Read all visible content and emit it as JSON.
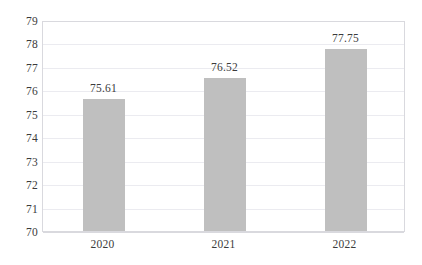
{
  "chart_data": {
    "type": "bar",
    "title": "",
    "subtitle": "",
    "xlabel": "",
    "ylabel": "",
    "categories": [
      "2020",
      "2021",
      "2022"
    ],
    "values": [
      75.61,
      76.52,
      77.75
    ],
    "data_labels": [
      "75.61",
      "76.52",
      "77.75"
    ],
    "ylim": [
      70,
      79
    ],
    "ytick_step": 1,
    "ytick_labels": [
      "79",
      "78",
      "77",
      "76",
      "75",
      "74",
      "73",
      "72",
      "71",
      "70"
    ],
    "grid": "horizontal",
    "legend": "none",
    "bar_color": "#bfbfbf",
    "gridline_color": "#ebebf0",
    "plot_border_color": "#d9d9de",
    "background_color": "#ffffff",
    "text_color": "#3b3b3b"
  }
}
